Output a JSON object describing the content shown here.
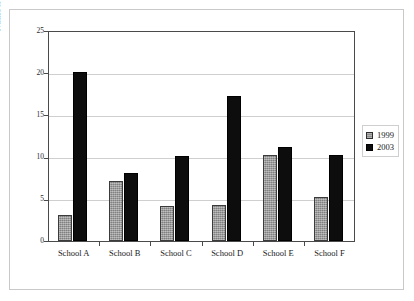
{
  "chart_data": {
    "type": "bar",
    "title": "",
    "subtitle": "",
    "xlabel": "",
    "ylabel": "Number of Agencies",
    "categories": [
      "School A",
      "School B",
      "School C",
      "School D",
      "School E",
      "School F"
    ],
    "series": [
      {
        "name": "1999",
        "color": "#9b9b9b",
        "values": [
          3.1,
          7.1,
          4.2,
          4.3,
          10.2,
          5.2
        ]
      },
      {
        "name": "2003",
        "color": "#0d0d0d",
        "values": [
          20.0,
          8.0,
          10.1,
          17.2,
          11.1,
          10.2
        ]
      }
    ],
    "ylim": [
      0,
      25
    ],
    "ytick_labels": [
      "0",
      "5",
      "10",
      "15",
      "20",
      "25"
    ],
    "ytick_values": [
      0,
      5,
      10,
      15,
      20,
      25
    ],
    "grid": "horizontal",
    "legend_position": "right",
    "legend_entries": [
      "1999",
      "2003"
    ]
  },
  "figure": {
    "frame_color": "#c9c9c9",
    "plot_border_color": "#4a4a4a",
    "gridline_color": "#cfcfcf",
    "background": "#ffffff"
  }
}
